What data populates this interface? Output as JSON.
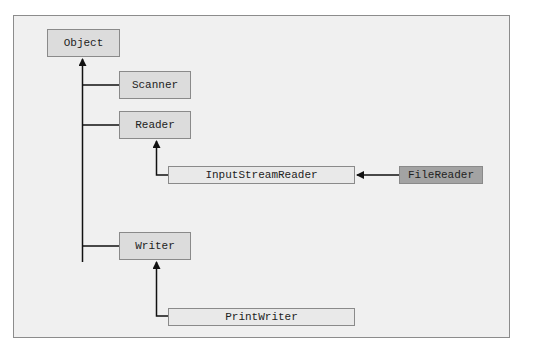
{
  "diagram": {
    "type": "class-hierarchy",
    "nodes": {
      "object": "Object",
      "scanner": "Scanner",
      "reader": "Reader",
      "input_stream_reader": "InputStreamReader",
      "file_reader": "FileReader",
      "writer": "Writer",
      "print_writer": "PrintWriter"
    },
    "edges": [
      {
        "from": "Scanner",
        "to": "Object"
      },
      {
        "from": "Reader",
        "to": "Object"
      },
      {
        "from": "Writer",
        "to": "Object"
      },
      {
        "from": "InputStreamReader",
        "to": "Reader"
      },
      {
        "from": "FileReader",
        "to": "InputStreamReader"
      },
      {
        "from": "PrintWriter",
        "to": "Writer"
      }
    ],
    "colors": {
      "frame_bg": "#f0f0f0",
      "box_fill": "#dcdcdc",
      "box_light_fill": "#e9e9e9",
      "highlight_fill": "#a3a3a3",
      "line": "#111111"
    }
  }
}
